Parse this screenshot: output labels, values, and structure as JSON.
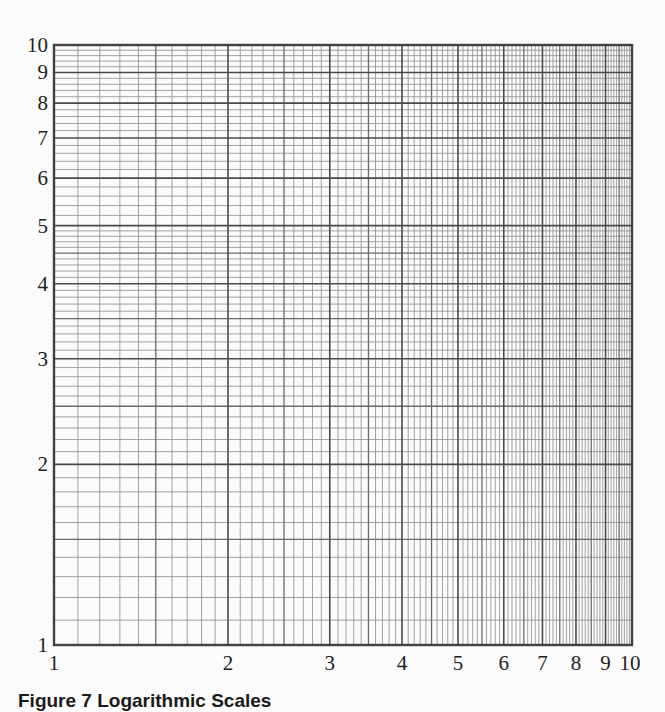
{
  "chart_data": {
    "type": "table",
    "subtype": "log-log graph paper",
    "title": "",
    "caption": "Figure 7 Logarithmic Scales",
    "xlabel": "",
    "ylabel": "",
    "x_scale": "log",
    "y_scale": "log",
    "xlim": [
      1,
      10
    ],
    "ylim": [
      1,
      10
    ],
    "x_ticks": [
      1,
      2,
      3,
      4,
      5,
      6,
      7,
      8,
      9,
      10
    ],
    "y_ticks": [
      1,
      2,
      3,
      4,
      5,
      6,
      7,
      8,
      9,
      10
    ],
    "x_tick_labels": [
      "1",
      "2",
      "3",
      "4",
      "5",
      "6",
      "7",
      "8",
      "9",
      "10"
    ],
    "y_tick_labels": [
      "1",
      "2",
      "3",
      "4",
      "5",
      "6",
      "7",
      "8",
      "9",
      "10"
    ],
    "grid": true,
    "minor_grid": {
      "x": {
        "1-5": 0.1,
        "5-10": 0.1
      },
      "y": {
        "1-5": 0.1,
        "5-10": 0.2
      }
    },
    "series": []
  },
  "plot_area": {
    "left": 54,
    "top": 45,
    "right": 632,
    "bottom": 645
  },
  "colors": {
    "background": "#fbfbfb",
    "major_line": "#4a4a4a",
    "half_line": "#6a6a6a",
    "minor_line": "#8c8c8c",
    "frame": "#404040",
    "text": "#222222"
  }
}
